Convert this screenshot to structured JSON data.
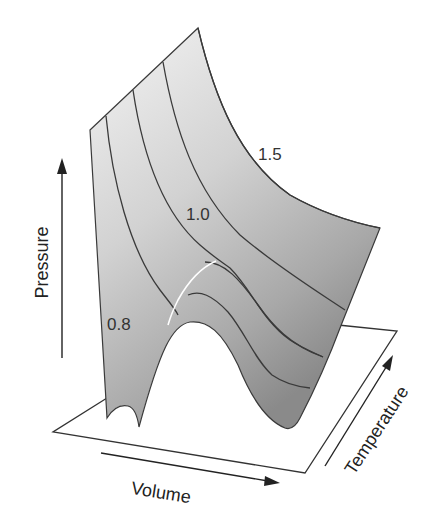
{
  "diagram": {
    "type": "pvt-surface",
    "axes": {
      "pressure": "Pressure",
      "volume": "Volume",
      "temperature": "Temperature"
    },
    "isotherm_labels": {
      "t15": "1.5",
      "t10": "1.0",
      "t08": "0.8"
    },
    "colors": {
      "surface_light": "#f2f2f2",
      "surface_dark": "#8c8c8c",
      "contour": "#3a3a3a",
      "axis_line": "#222222",
      "critical_curve": "#ffffff"
    }
  }
}
